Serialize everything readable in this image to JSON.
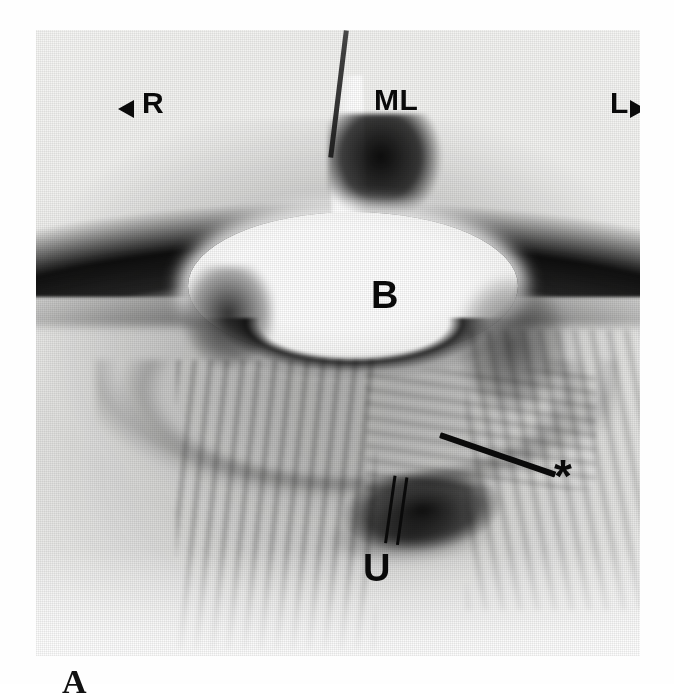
{
  "figure": {
    "panel_label": "A",
    "modality": "ultrasound",
    "view": "transverse pelvic scan",
    "background_color": "#ffffff",
    "annotation_color": "#0a0a0a"
  },
  "annotations": {
    "orientation_right": {
      "label": "R",
      "marker": "left-arrowhead",
      "meaning": "patient right"
    },
    "orientation_left": {
      "label": "L",
      "marker": "right-arrowhead",
      "meaning": "patient left"
    },
    "midline": {
      "label": "ML",
      "meaning": "midline"
    },
    "bladder": {
      "label": "B",
      "meaning": "urinary bladder"
    },
    "uterus": {
      "label": "U",
      "marker": "double-line-pointer",
      "meaning": "uterus"
    },
    "asterisk": {
      "label": "*",
      "marker": "leader-line",
      "meaning": "region of interest"
    }
  }
}
